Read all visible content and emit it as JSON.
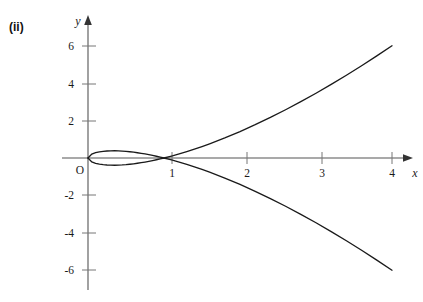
{
  "figure": {
    "label": "(ii)"
  },
  "chart_data": {
    "type": "line",
    "title": "",
    "subtitle": "",
    "xlabel": "x",
    "ylabel": "y",
    "xlim": [
      -0.25,
      4.35
    ],
    "ylim": [
      -7.0,
      7.0
    ],
    "grid": false,
    "legend": null,
    "x_ticks": [
      1,
      2,
      3,
      4
    ],
    "x_tick_labels": [
      "1",
      "2",
      "3",
      "4"
    ],
    "y_ticks": [
      -6,
      -4,
      -2,
      2,
      4,
      6
    ],
    "y_tick_labels": [
      "-6",
      "-4",
      "-2",
      "2",
      "4",
      "6"
    ],
    "origin_label": "O",
    "equation": "y^2 = x(x-1)^2",
    "annotations": [],
    "series": [
      {
        "name": "upper-branch",
        "formula": "y = (x-1)*sqrt(x)",
        "color": "#1a1a1a",
        "x": [
          0,
          0.05,
          0.1,
          0.15,
          0.2,
          0.25,
          0.3,
          0.35,
          0.4,
          0.45,
          0.5,
          0.55,
          0.6,
          0.65,
          0.7,
          0.75,
          0.8,
          0.85,
          0.9,
          0.95,
          1.0,
          1.1,
          1.2,
          1.3,
          1.4,
          1.5,
          1.6,
          1.8,
          2.0,
          2.2,
          2.4,
          2.6,
          2.8,
          3.0,
          3.2,
          3.4,
          3.6,
          3.8,
          4.0
        ],
        "y": [
          0,
          0.212,
          0.285,
          0.329,
          0.358,
          0.375,
          0.383,
          0.385,
          0.379,
          0.369,
          0.354,
          0.334,
          0.31,
          0.282,
          0.251,
          0.217,
          0.179,
          0.138,
          0.095,
          0.049,
          0,
          0.105,
          0.219,
          0.342,
          0.473,
          0.612,
          0.759,
          1.073,
          1.414,
          1.78,
          2.169,
          2.58,
          3.011,
          3.464,
          3.935,
          4.426,
          4.934,
          5.459,
          6.0
        ]
      },
      {
        "name": "lower-branch",
        "formula": "y = -(x-1)*sqrt(x)",
        "color": "#1a1a1a",
        "x": [
          0,
          0.05,
          0.1,
          0.15,
          0.2,
          0.25,
          0.3,
          0.35,
          0.4,
          0.45,
          0.5,
          0.55,
          0.6,
          0.65,
          0.7,
          0.75,
          0.8,
          0.85,
          0.9,
          0.95,
          1.0,
          1.1,
          1.2,
          1.3,
          1.4,
          1.5,
          1.6,
          1.8,
          2.0,
          2.2,
          2.4,
          2.6,
          2.8,
          3.0,
          3.2,
          3.4,
          3.6,
          3.8,
          4.0
        ],
        "y": [
          0,
          -0.212,
          -0.285,
          -0.329,
          -0.358,
          -0.375,
          -0.383,
          -0.385,
          -0.379,
          -0.369,
          -0.354,
          -0.334,
          -0.31,
          -0.282,
          -0.251,
          -0.217,
          -0.179,
          -0.138,
          -0.095,
          -0.049,
          0,
          -0.105,
          -0.219,
          -0.342,
          -0.473,
          -0.612,
          -0.759,
          -1.073,
          -1.414,
          -1.78,
          -2.169,
          -2.58,
          -3.011,
          -3.464,
          -3.935,
          -4.426,
          -4.934,
          -5.459,
          -6.0
        ]
      }
    ],
    "features": {
      "loop_interval": [
        0,
        1
      ],
      "node_point": [
        1,
        0
      ],
      "loop_max_y": 0.385,
      "loop_min_y": -0.385,
      "endpoint_upper": [
        4,
        6
      ],
      "endpoint_lower": [
        4,
        -6
      ]
    },
    "colors": {
      "curve": "#1a1a1a",
      "axis": "#555555",
      "background": "#ffffff"
    }
  }
}
